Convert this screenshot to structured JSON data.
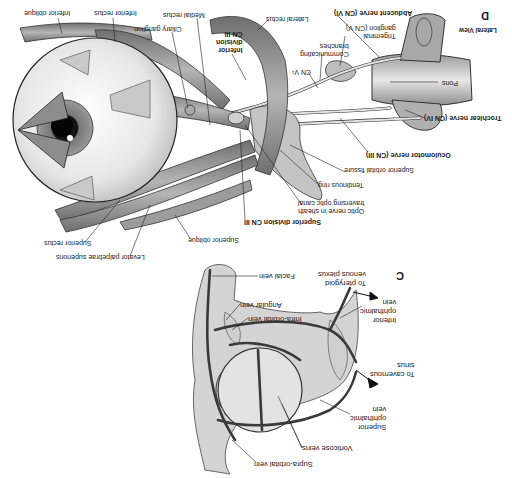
{
  "figure": {
    "orientation": "rotated-180",
    "panels": [
      {
        "id": "C",
        "letter": "C",
        "subject": "Veins of the orbit",
        "labels": {
          "pterygoid": "To pterygoid\nvenous plexus",
          "facial_vein": "Facial vein",
          "angular_vein": "Angular vein",
          "infra_orbital_vein": "Infra-orbital vein",
          "inferior_ophthalmic_vein": "Inferior\nophthalmic\nvein",
          "cavernous_sinus": "To cavernous\nsinus",
          "superior_ophthalmic_vein": "Superior\nophthalmic\nvein",
          "vorticose_veins": "Vorticose veins",
          "supra_orbital_vein": "Supra-orbital vein"
        }
      },
      {
        "id": "D",
        "letter": "D",
        "view": "Lateral View",
        "subject": "Nerves and muscles of the orbit",
        "labels": {
          "inferior_oblique": "Inferior oblique",
          "inferior_rectus": "Inferior rectus",
          "medial_rectus": "Medial rectus",
          "ciliary_ganglion": "Ciliary ganglion",
          "inferior_division": "Inferior\ndivision\nCN III",
          "lateral_rectus": "Lateral rectus",
          "abducent_nerve": "Abducent nerve (CN VI)",
          "trigeminal_ganglion": "Trigeminal\nganglion (CN V)",
          "communicating_branches": "Communicating\nbranches",
          "cn_v1": "CN V¹",
          "pons": "Pons",
          "trochlear_nerve": "Trochlear nerve (CN IV)",
          "oculomotor_nerve": "Oculomotor nerve (CN III)",
          "superior_orbital_fissure": "Superior orbital fissure",
          "tendinous_ring": "Tendinous ring",
          "optic_nerve": "Optic nerve in sheath\ntraversing optic canal",
          "superior_division": "Superior division CN III",
          "superior_oblique": "Superior oblique",
          "superior_rectus": "Superior rectus",
          "levator": "Levator palpebrae superioris"
        }
      }
    ],
    "colors": {
      "ink": "#1a1a1a",
      "muscle": "#8a8a8a",
      "muscle_light": "#bdbdbd",
      "nerve": "#d9d9d9",
      "vein": "#4a4a4a",
      "globe": "#ececec",
      "bone": "#c8c8c8"
    }
  }
}
